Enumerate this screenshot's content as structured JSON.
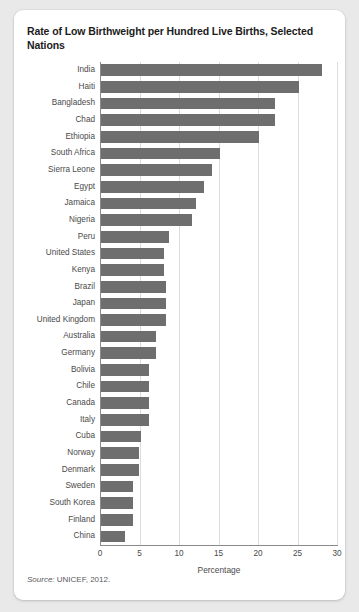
{
  "figure": {
    "title": "Rate of Low Birthweight per Hundred Live Births, Selected Nations",
    "source_prefix": "Source:",
    "source_text": " UNICEF, 2012."
  },
  "colors": {
    "bar": "#6e6e6e",
    "gridline": "#dcdcdc",
    "axis": "#8a8a8a",
    "card_background": "#ffffff",
    "page_background": "#e9e9e9",
    "label_text": "#4a4a4a",
    "title_text": "#1c1c1c"
  },
  "chart_data": {
    "type": "bar",
    "orientation": "horizontal",
    "title": "Rate of Low Birthweight per Hundred Live Births, Selected Nations",
    "xlabel": "Percentage",
    "ylabel": "",
    "xlim": [
      0,
      30
    ],
    "xticks": [
      0,
      5,
      10,
      15,
      20,
      25,
      30
    ],
    "grid": "vertical",
    "legend": "none",
    "categories": [
      "India",
      "Haiti",
      "Bangladesh",
      "Chad",
      "Ethiopia",
      "South Africa",
      "Sierra Leone",
      "Egypt",
      "Jamaica",
      "Nigeria",
      "Peru",
      "United States",
      "Kenya",
      "Brazil",
      "Japan",
      "United Kingdom",
      "Australia",
      "Germany",
      "Bolivia",
      "Chile",
      "Canada",
      "Italy",
      "Cuba",
      "Norway",
      "Denmark",
      "Sweden",
      "South Korea",
      "Finland",
      "China"
    ],
    "values": [
      28,
      25,
      22,
      22,
      20,
      15,
      14,
      13,
      12,
      11.5,
      8.6,
      8,
      8,
      8.2,
      8.2,
      8.2,
      7,
      7,
      6.1,
      6.1,
      6.1,
      6.1,
      5,
      4.8,
      4.8,
      4,
      4,
      4,
      3
    ]
  }
}
